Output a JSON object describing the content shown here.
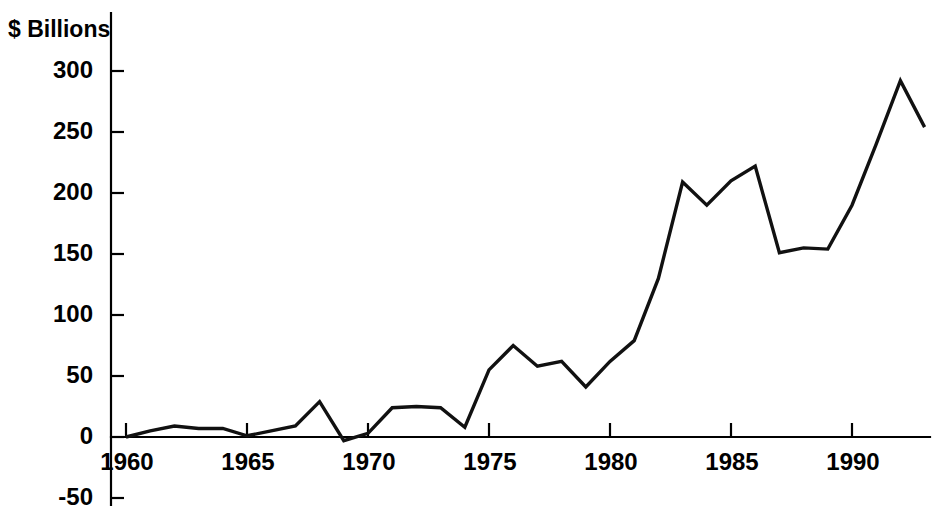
{
  "chart_data": {
    "type": "line",
    "title": "",
    "ylabel": "$ Billions",
    "xlabel": "",
    "ylim": [
      -50,
      310
    ],
    "xlim": [
      1959.3,
      1993.6
    ],
    "grid": false,
    "legend": null,
    "ytick_labels": [
      "300",
      "250",
      "200",
      "150",
      "100",
      "50",
      "0",
      "-50"
    ],
    "ytick_values": [
      300,
      250,
      200,
      150,
      100,
      50,
      0,
      -50
    ],
    "xtick_labels": [
      "1960",
      "1965",
      "1970",
      "1975",
      "1980",
      "1985",
      "1990"
    ],
    "xtick_values": [
      1960,
      1965,
      1970,
      1975,
      1980,
      1985,
      1990
    ],
    "line_color": "#111111",
    "x": [
      1960,
      1961,
      1962,
      1963,
      1964,
      1965,
      1966,
      1967,
      1968,
      1969,
      1970,
      1971,
      1972,
      1973,
      1974,
      1975,
      1976,
      1977,
      1978,
      1979,
      1980,
      1981,
      1982,
      1983,
      1984,
      1985,
      1986,
      1987,
      1988,
      1989,
      1990,
      1991,
      1992,
      1993
    ],
    "values": [
      0,
      5,
      9,
      7,
      7,
      1,
      5,
      9,
      29,
      -3,
      3,
      24,
      25,
      24,
      8,
      55,
      75,
      58,
      62,
      41,
      62,
      79,
      130,
      209,
      190,
      210,
      222,
      151,
      155,
      154,
      190,
      240,
      292,
      254
    ],
    "series": [
      {
        "name": "$ Billions",
        "values": [
          0,
          5,
          9,
          7,
          7,
          1,
          5,
          9,
          29,
          -3,
          3,
          24,
          25,
          24,
          8,
          55,
          75,
          58,
          62,
          41,
          62,
          79,
          130,
          209,
          190,
          210,
          222,
          151,
          155,
          154,
          190,
          240,
          292,
          254
        ]
      }
    ]
  },
  "axis": {
    "y_title": "$ Billions"
  }
}
